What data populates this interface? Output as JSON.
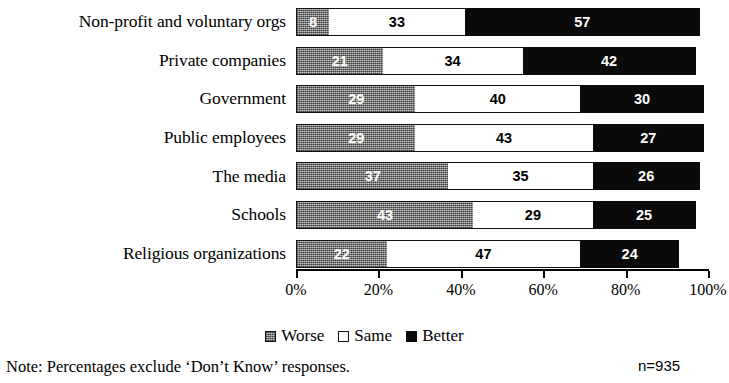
{
  "chart_data": {
    "type": "bar",
    "subtype": "stacked-horizontal-100",
    "title": "",
    "xlabel": "",
    "ylabel": "",
    "xlim": [
      0,
      100
    ],
    "grid": false,
    "legend_position": "bottom-center",
    "categories": [
      "Non-profit and voluntary orgs",
      "Private companies",
      "Government",
      "Public employees",
      "The media",
      "Schools",
      "Religious organizations"
    ],
    "series": [
      {
        "name": "Worse",
        "color": "#8a8a8a",
        "values": [
          8,
          21,
          29,
          29,
          37,
          43,
          22
        ]
      },
      {
        "name": "Same",
        "color": "#ffffff",
        "values": [
          33,
          34,
          40,
          43,
          35,
          29,
          47
        ]
      },
      {
        "name": "Better",
        "color": "#0a0a0a",
        "values": [
          57,
          42,
          30,
          27,
          26,
          25,
          24
        ]
      }
    ],
    "tick_labels": [
      "0%",
      "20%",
      "40%",
      "60%",
      "80%",
      "100%"
    ],
    "tick_values": [
      0,
      20,
      40,
      60,
      80,
      100
    ],
    "annotations": {
      "note": "Note: Percentages exclude ‘Don’t Know’ responses.",
      "sample_size": "n=935"
    }
  }
}
